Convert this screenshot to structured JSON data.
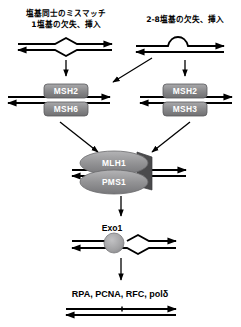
{
  "diagram": {
    "background_color": "#ffffff",
    "line_color": "#000000",
    "protein_fill": "#8d8d8f",
    "protein_text_color": "#ffffff"
  },
  "top_labels": {
    "left_line1": "塩基同士のミスマッチ",
    "left_line2": "1塩基の欠失、挿入",
    "right_line1": "2-8塩基の欠失、挿入"
  },
  "complexes": {
    "left": {
      "top": "MSH2",
      "bottom": "MSH6"
    },
    "right": {
      "top": "MSH2",
      "bottom": "MSH3"
    },
    "middle": {
      "top": "MLH1",
      "bottom": "PMS1"
    }
  },
  "exonuclease": {
    "label": "Exo1"
  },
  "repair_factors": {
    "label": "RPA,  PCNA, RFC, polδ"
  }
}
